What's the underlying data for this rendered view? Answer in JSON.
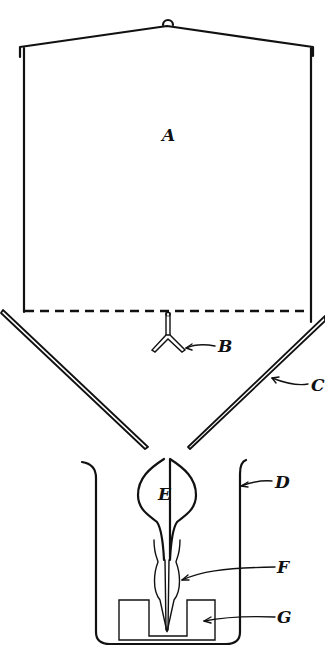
{
  "diagram": {
    "type": "apparatus line drawing",
    "labels": {
      "A": "A",
      "B": "B",
      "C": "C",
      "D": "D",
      "E": "E",
      "F": "F",
      "G": "G"
    },
    "parts": [
      {
        "id": "A",
        "description": "upper enclosure / chamber with peaked lid"
      },
      {
        "id": "B",
        "description": "three-pronged hanger below dashed line"
      },
      {
        "id": "C",
        "description": "funnel-shaped slanted walls"
      },
      {
        "id": "D",
        "description": "outer vessel / beaker"
      },
      {
        "id": "E",
        "description": "bulb-shaped flask"
      },
      {
        "id": "F",
        "description": "tapered stem / tube"
      },
      {
        "id": "G",
        "description": "block support at base"
      }
    ],
    "colors": {
      "ink": "#111111",
      "background": "#ffffff"
    }
  }
}
